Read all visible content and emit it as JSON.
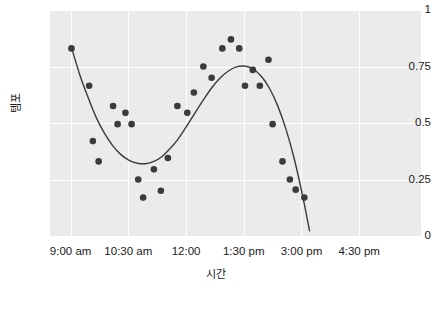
{
  "chart_data": {
    "type": "scatter",
    "title": "",
    "xlabel": "시간",
    "ylabel": "템포",
    "grid": true,
    "legend": null,
    "xlim": [
      0,
      9.0
    ],
    "ylim": [
      0,
      1
    ],
    "x_tick_labels": [
      "9:00 am",
      "10:30 am",
      "12:00",
      "1:30 pm",
      "3:00 pm",
      "4:30 pm"
    ],
    "x_tick_values": [
      0.5,
      1.9,
      3.3,
      4.7,
      6.1,
      7.5
    ],
    "y_tick_labels": [
      "0",
      "0.25",
      "0.5",
      "0.75",
      "1"
    ],
    "y_tick_values": [
      0,
      0.25,
      0.5,
      0.75,
      1
    ],
    "point_color": "#3b3b3b",
    "line_color": "#3b3b3b",
    "panel_color": "#ebebeb",
    "grid_color": "#ffffff",
    "points": [
      {
        "x": 0.52,
        "y": 0.83
      },
      {
        "x": 0.95,
        "y": 0.665
      },
      {
        "x": 1.04,
        "y": 0.42
      },
      {
        "x": 1.18,
        "y": 0.33
      },
      {
        "x": 1.53,
        "y": 0.575
      },
      {
        "x": 1.64,
        "y": 0.495
      },
      {
        "x": 1.83,
        "y": 0.545
      },
      {
        "x": 1.98,
        "y": 0.495
      },
      {
        "x": 2.14,
        "y": 0.25
      },
      {
        "x": 2.26,
        "y": 0.17
      },
      {
        "x": 2.52,
        "y": 0.295
      },
      {
        "x": 2.69,
        "y": 0.2
      },
      {
        "x": 2.86,
        "y": 0.345
      },
      {
        "x": 3.09,
        "y": 0.575
      },
      {
        "x": 3.33,
        "y": 0.545
      },
      {
        "x": 3.49,
        "y": 0.635
      },
      {
        "x": 3.72,
        "y": 0.75
      },
      {
        "x": 3.92,
        "y": 0.7
      },
      {
        "x": 4.18,
        "y": 0.83
      },
      {
        "x": 4.39,
        "y": 0.87
      },
      {
        "x": 4.59,
        "y": 0.83
      },
      {
        "x": 4.73,
        "y": 0.665
      },
      {
        "x": 4.92,
        "y": 0.735
      },
      {
        "x": 5.09,
        "y": 0.665
      },
      {
        "x": 5.3,
        "y": 0.78
      },
      {
        "x": 5.4,
        "y": 0.495
      },
      {
        "x": 5.64,
        "y": 0.33
      },
      {
        "x": 5.82,
        "y": 0.25
      },
      {
        "x": 5.96,
        "y": 0.205
      },
      {
        "x": 6.17,
        "y": 0.17
      }
    ],
    "fit_curve": [
      {
        "x": 0.52,
        "y": 0.835
      },
      {
        "x": 0.72,
        "y": 0.715
      },
      {
        "x": 0.92,
        "y": 0.615
      },
      {
        "x": 1.12,
        "y": 0.525
      },
      {
        "x": 1.32,
        "y": 0.455
      },
      {
        "x": 1.52,
        "y": 0.4
      },
      {
        "x": 1.72,
        "y": 0.36
      },
      {
        "x": 1.92,
        "y": 0.335
      },
      {
        "x": 2.12,
        "y": 0.322
      },
      {
        "x": 2.32,
        "y": 0.32
      },
      {
        "x": 2.52,
        "y": 0.33
      },
      {
        "x": 2.72,
        "y": 0.352
      },
      {
        "x": 2.92,
        "y": 0.388
      },
      {
        "x": 3.12,
        "y": 0.432
      },
      {
        "x": 3.32,
        "y": 0.487
      },
      {
        "x": 3.52,
        "y": 0.545
      },
      {
        "x": 3.72,
        "y": 0.602
      },
      {
        "x": 3.92,
        "y": 0.655
      },
      {
        "x": 4.12,
        "y": 0.698
      },
      {
        "x": 4.32,
        "y": 0.729
      },
      {
        "x": 4.52,
        "y": 0.748
      },
      {
        "x": 4.72,
        "y": 0.752
      },
      {
        "x": 4.92,
        "y": 0.74
      },
      {
        "x": 5.12,
        "y": 0.708
      },
      {
        "x": 5.32,
        "y": 0.655
      },
      {
        "x": 5.52,
        "y": 0.578
      },
      {
        "x": 5.72,
        "y": 0.475
      },
      {
        "x": 5.92,
        "y": 0.345
      },
      {
        "x": 6.12,
        "y": 0.185
      },
      {
        "x": 6.3,
        "y": 0.02
      }
    ]
  }
}
